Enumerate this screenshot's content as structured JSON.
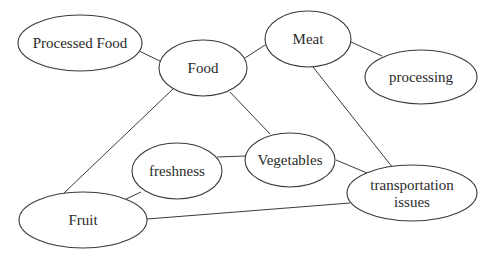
{
  "diagram": {
    "type": "concept-map",
    "nodes": [
      {
        "id": "processed_food",
        "label": "Processed Food",
        "cx": 80,
        "cy": 43,
        "rx": 62,
        "ry": 28
      },
      {
        "id": "food",
        "label": "Food",
        "cx": 203,
        "cy": 68,
        "rx": 44,
        "ry": 28
      },
      {
        "id": "meat",
        "label": "Meat",
        "cx": 308,
        "cy": 39,
        "rx": 43,
        "ry": 28
      },
      {
        "id": "processing",
        "label": "processing",
        "cx": 421,
        "cy": 77,
        "rx": 56,
        "ry": 27
      },
      {
        "id": "freshness",
        "label": "freshness",
        "cx": 177,
        "cy": 171,
        "rx": 45,
        "ry": 28
      },
      {
        "id": "vegetables",
        "label": "Vegetables",
        "cx": 290,
        "cy": 160,
        "rx": 45,
        "ry": 27
      },
      {
        "id": "transportation",
        "label": "transportation issues",
        "line1": "transportation",
        "line2": "issues",
        "cx": 412,
        "cy": 193,
        "rx": 65,
        "ry": 28
      },
      {
        "id": "fruit",
        "label": "Fruit",
        "cx": 83,
        "cy": 220,
        "rx": 64,
        "ry": 28
      }
    ],
    "edges": [
      {
        "from": "processed_food",
        "to": "food",
        "x1": 139,
        "y1": 51,
        "x2": 162,
        "y2": 62
      },
      {
        "from": "food",
        "to": "meat",
        "x1": 245,
        "y1": 58,
        "x2": 265,
        "y2": 45
      },
      {
        "from": "meat",
        "to": "processing",
        "x1": 351,
        "y1": 42,
        "x2": 382,
        "y2": 56
      },
      {
        "from": "food",
        "to": "vegetables",
        "x1": 230,
        "y1": 92,
        "x2": 270,
        "y2": 134
      },
      {
        "from": "food",
        "to": "fruit",
        "x1": 173,
        "y1": 89,
        "x2": 64,
        "y2": 193
      },
      {
        "from": "meat",
        "to": "transportation",
        "x1": 313,
        "y1": 67,
        "x2": 393,
        "y2": 168
      },
      {
        "from": "freshness",
        "to": "vegetables",
        "x1": 217,
        "y1": 157,
        "x2": 245,
        "y2": 156
      },
      {
        "from": "freshness",
        "to": "fruit",
        "x1": 141,
        "y1": 192,
        "x2": 126,
        "y2": 199
      },
      {
        "from": "vegetables",
        "to": "transportation",
        "x1": 336,
        "y1": 160,
        "x2": 367,
        "y2": 173
      },
      {
        "from": "fruit",
        "to": "transportation",
        "x1": 147,
        "y1": 219,
        "x2": 350,
        "y2": 203
      }
    ],
    "colors": {
      "stroke": "#3a3a3a",
      "text": "#2a2a2a",
      "background": "#ffffff"
    }
  }
}
